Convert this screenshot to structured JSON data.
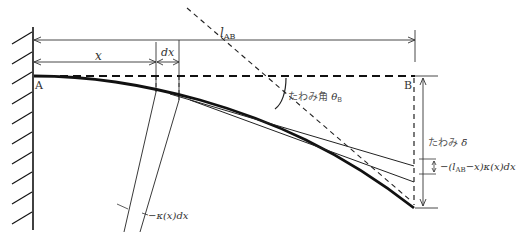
{
  "diagram": {
    "type": "cantilever-beam-deflection",
    "points": {
      "a": "A",
      "b": "B"
    },
    "dimensions": {
      "length": {
        "symbol": "l",
        "subscript": "AB"
      },
      "x": "x",
      "dx": "dx"
    },
    "labels": {
      "deflection_angle_text": "たわみ角",
      "deflection_angle_symbol": "θ",
      "deflection_angle_sub": "B",
      "deflection_text": "たわみ",
      "deflection_symbol": "δ̄",
      "increment_prefix": "−(",
      "increment_l": "l",
      "increment_l_sub": "AB",
      "increment_suffix": "−x)κ(x)dx",
      "curvature": "−κ(x)dx"
    }
  }
}
